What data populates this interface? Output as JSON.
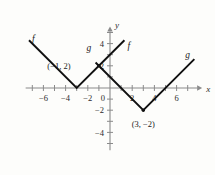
{
  "chart_data": {
    "type": "line",
    "title": "",
    "xlabel": "x",
    "ylabel": "y",
    "xlim": [
      -7.6,
      8.2
    ],
    "ylim": [
      -5.6,
      5.4
    ],
    "grid": false,
    "legend": "inline-curve-labels",
    "x_ticks": [
      -6,
      -4,
      -2,
      0,
      2,
      4,
      6
    ],
    "x_tick_labels": [
      "−6",
      "−4",
      "−2",
      "0",
      "2",
      "4",
      "6"
    ],
    "y_ticks": [
      -4,
      -2,
      2,
      4
    ],
    "y_tick_labels": [
      "−4",
      "−2",
      "2",
      "4"
    ],
    "minor_x_ticks": [
      -7,
      -5,
      -3,
      -1,
      1,
      3,
      5,
      7
    ],
    "minor_y_ticks": [
      -5,
      -3,
      -1,
      1,
      3,
      5
    ],
    "series": [
      {
        "name": "f",
        "equation_shape": "absolute-value V",
        "vertex": [
          -3,
          0
        ],
        "points": [
          [
            -7.3,
            4.3
          ],
          [
            -3,
            0
          ],
          [
            1.3,
            4.3
          ]
        ],
        "color": "#111111"
      },
      {
        "name": "g",
        "equation_shape": "absolute-value V",
        "vertex": [
          3,
          -2
        ],
        "points": [
          [
            -1.3,
            2.3
          ],
          [
            3,
            -2
          ],
          [
            7.6,
            2.6
          ]
        ],
        "color": "#111111"
      }
    ],
    "annotations": [
      {
        "text": "(−1, 2)",
        "point": [
          -1,
          2
        ],
        "label_x": -4.6,
        "label_y": 2.0
      },
      {
        "text": "(3, −2)",
        "point": [
          3,
          -2
        ],
        "label_x": 3.0,
        "label_y": -3.2
      }
    ],
    "curve_labels": [
      {
        "text": "f",
        "x": -6.9,
        "y": 4.1
      },
      {
        "text": "f",
        "x": 1.7,
        "y": 3.5
      },
      {
        "text": "g",
        "x": -1.9,
        "y": 3.3
      },
      {
        "text": "g",
        "x": 7.0,
        "y": 2.7
      }
    ]
  },
  "figure": {
    "background_color": "#fdfdfb",
    "axis_color": "#8a8a8a",
    "curve_color": "#111111"
  }
}
